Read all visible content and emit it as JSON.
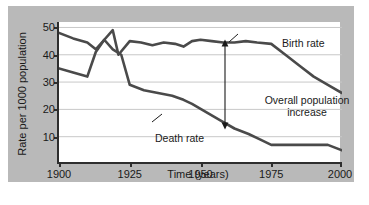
{
  "chart_data": {
    "type": "line",
    "title": "",
    "xlabel": "Time (years)",
    "ylabel": "Rate per 1000 population",
    "xlim": [
      1900,
      2000
    ],
    "ylim": [
      0,
      52
    ],
    "xticks": [
      1900,
      1925,
      1950,
      1975,
      2000
    ],
    "yticks": [
      10,
      20,
      30,
      40,
      50
    ],
    "grid": "horizontal",
    "legend": "inline-annotations",
    "series": [
      {
        "name": "Birth rate",
        "color": "#4a4a4a",
        "x": [
          1900,
          1905,
          1910,
          1913,
          1916,
          1919,
          1921,
          1925,
          1929,
          1933,
          1937,
          1941,
          1944,
          1947,
          1950,
          1954,
          1958,
          1962,
          1966,
          1970,
          1975,
          1980,
          1985,
          1990,
          1995,
          2000
        ],
        "values": [
          48,
          46,
          44.5,
          42,
          45.5,
          49,
          40,
          45,
          44.5,
          43.5,
          44.5,
          44,
          43,
          45,
          45.5,
          45,
          44.5,
          44.5,
          45,
          44.5,
          44,
          40,
          36,
          32,
          29,
          26
        ]
      },
      {
        "name": "Death rate",
        "color": "#4a4a4a",
        "x": [
          1900,
          1905,
          1910,
          1913,
          1916,
          1919,
          1922,
          1925,
          1930,
          1935,
          1940,
          1944,
          1947,
          1952,
          1957,
          1962,
          1967,
          1971,
          1975,
          1982,
          1990,
          1995,
          2000
        ],
        "values": [
          35,
          33.5,
          32,
          41,
          45.5,
          42,
          40,
          29,
          27,
          26,
          25,
          23.5,
          22,
          19,
          16,
          13,
          11,
          9,
          7,
          7,
          7,
          7,
          5
        ]
      }
    ],
    "annotations": [
      {
        "name": "birth-rate-label",
        "text": "Birth rate",
        "leader": true
      },
      {
        "name": "death-rate-label",
        "text": "Death rate",
        "leader": true
      },
      {
        "name": "overall-increase-label",
        "text": "Overall population increase",
        "line1": "Overall population",
        "line2": "increase",
        "arrow": "double-headed-vertical",
        "arrow_year": 1967,
        "arrow_from": 44.5,
        "arrow_to": 11
      }
    ]
  },
  "axes": {
    "y_ticks": [
      "50",
      "40",
      "30",
      "20",
      "10"
    ],
    "x_ticks": [
      "1900",
      "1925",
      "1950",
      "1975",
      "2000"
    ],
    "y_label": "Rate per 1000 population",
    "x_label": "Time (years)"
  },
  "labels": {
    "birth_rate": "Birth rate",
    "death_rate": "Death rate",
    "overall_line1": "Overall population",
    "overall_line2": "increase"
  },
  "colors": {
    "panel_background": "#b9b9b9",
    "plot_background": "#ffffff",
    "axis": "#2e2e2e",
    "line": "#4a4a4a",
    "grid": "#c8c8c8",
    "text": "#1a1a1a"
  }
}
